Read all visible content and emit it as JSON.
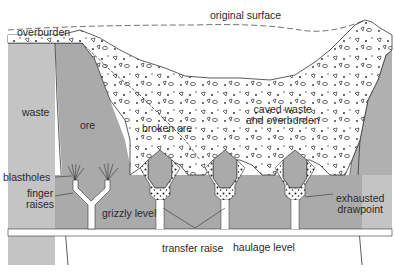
{
  "diagram": {
    "colors": {
      "waste_rock": "#c4c4c4",
      "ore_rock": "#aaaaaa",
      "lower_rock": "#b4b4b4",
      "broken_material": "#ffffff",
      "line": "#333333"
    },
    "labels": {
      "original_surface": "original surface",
      "overburden": "overburden",
      "waste": "waste",
      "ore": "ore",
      "broken_ore": "broken ore",
      "caved_waste_line1": "caved waste",
      "caved_waste_line2": "and overburden",
      "blastholes": "blastholes",
      "finger_raises_line1": "finger",
      "finger_raises_line2": "raises",
      "grizzly_level": "grizzly level",
      "exhausted_drawpoint_line1": "exhausted",
      "exhausted_drawpoint_line2": "drawpoint",
      "transfer_raise": "transfer raise",
      "haulage_level": "haulage level"
    }
  }
}
